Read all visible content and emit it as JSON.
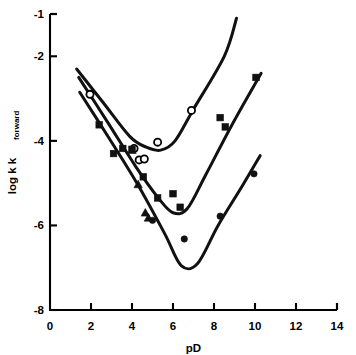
{
  "chart_data": {
    "type": "scatter",
    "title": "",
    "xlabel": "pD",
    "ylabel": "log k",
    "ylabel_sub": "forward",
    "xlim": [
      0,
      14
    ],
    "ylim": [
      -8,
      -1
    ],
    "xticks": [
      0,
      2,
      4,
      6,
      8,
      10,
      12,
      14
    ],
    "xtick_labels": [
      "0",
      "2",
      "4",
      "6",
      "8",
      "10",
      "12",
      "14"
    ],
    "yticks": [
      -1,
      -2,
      -4,
      -6,
      -8
    ],
    "ytick_labels": [
      "-1",
      "-2",
      "-4",
      "-6",
      "-8"
    ],
    "grid": false,
    "legend": "none",
    "axis_style": "left-and-bottom-spines-with-outward-ticks",
    "series": [
      {
        "name": "open-circle-series",
        "marker": "open-circle",
        "points": [
          {
            "x": 1.95,
            "y": -2.9
          },
          {
            "x": 4.1,
            "y": -4.18
          },
          {
            "x": 4.35,
            "y": -4.45
          },
          {
            "x": 4.6,
            "y": -4.43
          },
          {
            "x": 5.25,
            "y": -4.03
          },
          {
            "x": 6.9,
            "y": -3.28
          }
        ]
      },
      {
        "name": "filled-square-series",
        "marker": "filled-square",
        "points": [
          {
            "x": 2.4,
            "y": -3.62
          },
          {
            "x": 3.1,
            "y": -4.3
          },
          {
            "x": 3.55,
            "y": -4.18
          },
          {
            "x": 4.0,
            "y": -4.2
          },
          {
            "x": 4.55,
            "y": -4.85
          },
          {
            "x": 5.25,
            "y": -5.35
          },
          {
            "x": 6.0,
            "y": -5.25
          },
          {
            "x": 6.35,
            "y": -5.57
          },
          {
            "x": 8.3,
            "y": -3.45
          },
          {
            "x": 8.55,
            "y": -3.67
          },
          {
            "x": 10.05,
            "y": -2.5
          }
        ]
      },
      {
        "name": "filled-triangle-series",
        "marker": "filled-triangle",
        "points": [
          {
            "x": 4.0,
            "y": -4.22
          },
          {
            "x": 4.3,
            "y": -5.03
          },
          {
            "x": 4.65,
            "y": -5.7
          },
          {
            "x": 4.8,
            "y": -5.82
          }
        ]
      },
      {
        "name": "filled-circle-series",
        "marker": "filled-circle",
        "points": [
          {
            "x": 5.0,
            "y": -5.88
          },
          {
            "x": 6.55,
            "y": -6.32
          },
          {
            "x": 8.3,
            "y": -5.78
          },
          {
            "x": 9.95,
            "y": -4.78
          }
        ]
      }
    ],
    "curves": [
      {
        "name": "upper-curve",
        "minimum": {
          "x": 5.6,
          "y": -4.22
        },
        "path_points": [
          {
            "x": 1.3,
            "y": -2.3
          },
          {
            "x": 2.6,
            "y": -3.1
          },
          {
            "x": 3.9,
            "y": -3.9
          },
          {
            "x": 4.7,
            "y": -4.15
          },
          {
            "x": 5.4,
            "y": -4.22
          },
          {
            "x": 6.1,
            "y": -4.0
          },
          {
            "x": 7.0,
            "y": -3.25
          },
          {
            "x": 8.5,
            "y": -2.0
          },
          {
            "x": 9.1,
            "y": -1.1
          }
        ]
      },
      {
        "name": "middle-curve",
        "minimum": {
          "x": 6.2,
          "y": -5.72
        },
        "path_points": [
          {
            "x": 1.4,
            "y": -2.5
          },
          {
            "x": 2.8,
            "y": -3.55
          },
          {
            "x": 4.2,
            "y": -4.62
          },
          {
            "x": 5.3,
            "y": -5.36
          },
          {
            "x": 6.0,
            "y": -5.7
          },
          {
            "x": 6.7,
            "y": -5.6
          },
          {
            "x": 7.6,
            "y": -4.8
          },
          {
            "x": 8.9,
            "y": -3.6
          },
          {
            "x": 10.3,
            "y": -2.4
          }
        ]
      },
      {
        "name": "lower-curve",
        "minimum": {
          "x": 6.7,
          "y": -7.02
        },
        "path_points": [
          {
            "x": 1.45,
            "y": -2.85
          },
          {
            "x": 2.9,
            "y": -3.95
          },
          {
            "x": 4.3,
            "y": -5.05
          },
          {
            "x": 5.6,
            "y": -6.2
          },
          {
            "x": 6.4,
            "y": -6.95
          },
          {
            "x": 7.2,
            "y": -6.9
          },
          {
            "x": 8.2,
            "y": -6.0
          },
          {
            "x": 9.4,
            "y": -5.05
          },
          {
            "x": 10.25,
            "y": -4.35
          }
        ]
      }
    ]
  }
}
